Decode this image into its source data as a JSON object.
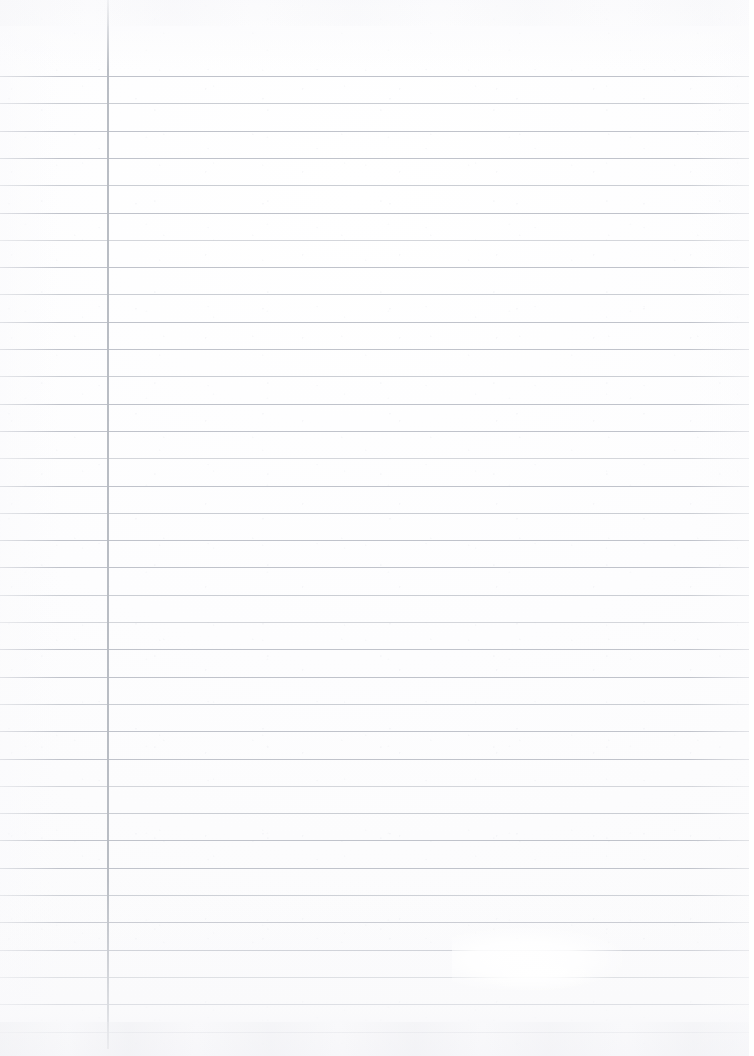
{
  "document": {
    "kind": "scanned-ruled-notebook-page",
    "title": "Blank Ruled Notebook Page",
    "description": "A scanned blank sheet of lined notebook paper with a vertical left margin rule and horizontal ruling lines. No handwriting, text, or marks are present.",
    "orientation": "portrait",
    "width_px": 754,
    "height_px": 1056,
    "written_content": "",
    "visible_text": ""
  },
  "paper": {
    "background_color": "#fdfdfe",
    "tint_color": "#fbfbfc",
    "texture": "faint scan grain"
  },
  "ruling": {
    "line_color": "#b9bdc5",
    "line_color_soft": "#c2c6cd",
    "line_color_faint": "#c9ccd2",
    "line_thickness_px": 1,
    "first_line_y_px": 76,
    "line_spacing_px": 27.3,
    "line_count": 36,
    "line_left_px": 0,
    "line_width_px": 754,
    "line_variants": [
      "normal",
      "soft",
      "normal",
      "normal",
      "soft",
      "normal",
      "faint",
      "normal",
      "soft",
      "normal",
      "normal",
      "soft",
      "normal",
      "normal",
      "faint",
      "normal",
      "soft",
      "normal",
      "normal",
      "soft",
      "faint",
      "normal",
      "normal",
      "soft",
      "normal",
      "normal",
      "faint",
      "soft",
      "normal",
      "normal",
      "soft",
      "normal",
      "normal",
      "soft",
      "normal",
      "faint"
    ]
  },
  "margin_rule": {
    "color": "#b5b9c1",
    "x_px": 107,
    "thickness_px": 1.6,
    "top_px": 0,
    "height_px": 1049,
    "orientation": "vertical"
  },
  "artifacts": {
    "glare_label": "scanner glare patch",
    "glare_x_px": 452,
    "glare_y_px": 928,
    "bottom_smudge_label": "bottom edge scan smudge",
    "top_smudge_label": "top edge scan smudge"
  }
}
